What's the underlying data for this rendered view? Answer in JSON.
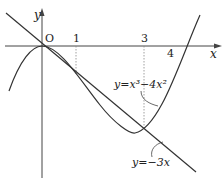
{
  "diagram": {
    "axes": {
      "x_label": "x",
      "y_label": "y",
      "origin_label": "O"
    },
    "ticks": {
      "one": "1",
      "three": "3",
      "four": "4"
    },
    "curves": {
      "cubic_label": "y=x³−4x²",
      "line_label": "y=−3x"
    }
  }
}
